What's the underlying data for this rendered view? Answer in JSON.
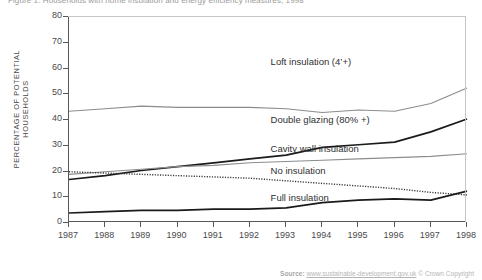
{
  "figure": {
    "title": "Figure 1: Households with home insulation and energy efficiency measures, 1998",
    "ylabel": "PERCENTAGE OF POTENTIAL HOUSEHOLDS",
    "source_prefix": "Source:",
    "source_url": "www.sustainable-development.gov.uk",
    "source_copyright": "© Crown Copyright"
  },
  "chart_data": {
    "type": "line",
    "title": "Households with home insulation and energy efficiency measures, 1998",
    "xlabel": "",
    "ylabel": "PERCENTAGE OF POTENTIAL HOUSEHOLDS",
    "x": [
      1987,
      1988,
      1989,
      1990,
      1991,
      1992,
      1993,
      1994,
      1995,
      1996,
      1997,
      1998
    ],
    "xtick_labels": [
      "1987",
      "1988",
      "1989",
      "1990",
      "1991",
      "1992",
      "1993",
      "1994",
      "1995",
      "1996",
      "1997",
      "1998"
    ],
    "ytick_labels": [
      "0",
      "10",
      "20",
      "30",
      "40",
      "50",
      "60",
      "70",
      "80"
    ],
    "yticks": [
      0,
      10,
      20,
      30,
      40,
      50,
      60,
      70,
      80
    ],
    "ylim": [
      0,
      80
    ],
    "xlim": [
      1987,
      1998
    ],
    "grid": false,
    "legend": "inline-annotations",
    "series": [
      {
        "name": "Loft insulation (4'+)",
        "label": "Loft insulation (4’+)",
        "color": "#8a8d90",
        "style": "solid",
        "width": 1.1,
        "values": [
          43,
          44,
          45,
          44.5,
          44.5,
          44.5,
          44,
          42.5,
          43.5,
          43,
          46,
          52
        ],
        "label_x": 1992.6,
        "label_y": 62
      },
      {
        "name": "Double glazing (80% +)",
        "label": "Double glazing (80% +)",
        "color": "#1a1a1a",
        "style": "solid",
        "width": 1.7,
        "values": [
          16.5,
          18,
          20,
          21.5,
          23,
          24.5,
          26,
          29,
          30,
          31,
          35,
          40
        ],
        "label_x": 1992.6,
        "label_y": 39.5
      },
      {
        "name": "Cavity wall insulation",
        "label": "Cavity wall insulation",
        "color": "#8a8d90",
        "style": "solid",
        "width": 1.1,
        "values": [
          18.5,
          19.5,
          20.5,
          21.5,
          22,
          23,
          23.5,
          24,
          24.5,
          25,
          25.5,
          26.5
        ],
        "label_x": 1992.6,
        "label_y": 28.5
      },
      {
        "name": "No insulation",
        "label": "No insulation",
        "color": "#3a3a3a",
        "style": "dotted",
        "width": 1.4,
        "values": [
          19.5,
          19,
          18.5,
          18,
          17.5,
          17,
          16,
          15,
          14,
          13,
          11.5,
          10.5
        ],
        "label_x": 1992.6,
        "label_y": 20
      },
      {
        "name": "Full insulation",
        "label": "Full insulation",
        "color": "#1a1a1a",
        "style": "solid",
        "width": 1.7,
        "values": [
          3.5,
          4,
          4.5,
          4.5,
          5,
          5,
          5.5,
          7.5,
          8.5,
          9,
          8.5,
          12
        ],
        "label_x": 1992.6,
        "label_y": 9.5
      }
    ]
  }
}
